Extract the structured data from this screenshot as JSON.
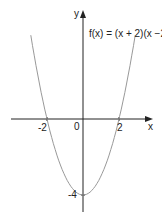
{
  "chart_data": {
    "type": "line",
    "title": "f(x) = (x + 2)(x −2)",
    "function": "f(x) = (x + 2)(x - 2)",
    "xlabel": "x",
    "ylabel": "y",
    "x_ticks": [
      -2,
      0,
      2
    ],
    "x_tick_labels": [
      "-2",
      "0",
      "2"
    ],
    "y_ticks": [
      -4
    ],
    "y_tick_labels": [
      "-4"
    ],
    "key_points": [
      {
        "x": -2,
        "y": 0,
        "label": "-2"
      },
      {
        "x": 2,
        "y": 0,
        "label": "2"
      },
      {
        "x": 0,
        "y": -4,
        "label": "-4"
      }
    ],
    "x": [
      -2.9,
      -2.5,
      -2,
      -1.5,
      -1,
      -0.5,
      0,
      0.5,
      1,
      1.5,
      2,
      2.5,
      2.9
    ],
    "series": [
      {
        "name": "f(x)",
        "values": [
          4.41,
          2.25,
          0,
          -1.75,
          -3,
          -3.75,
          -4,
          -3.75,
          -3,
          -1.75,
          0,
          2.25,
          4.41
        ]
      }
    ],
    "xlim": [
      -3.5,
      3.5
    ],
    "ylim": [
      -4.5,
      5.5
    ],
    "grid": false,
    "legend": "none",
    "colors": {
      "axis": "#222222",
      "curve": "#999999"
    }
  },
  "labels": {
    "equation": "f(x) = (x + 2)(x −2)",
    "x_axis": "x",
    "y_axis": "y",
    "origin": "0",
    "neg_two": "-2",
    "pos_two": "2",
    "neg_four": "-4"
  }
}
